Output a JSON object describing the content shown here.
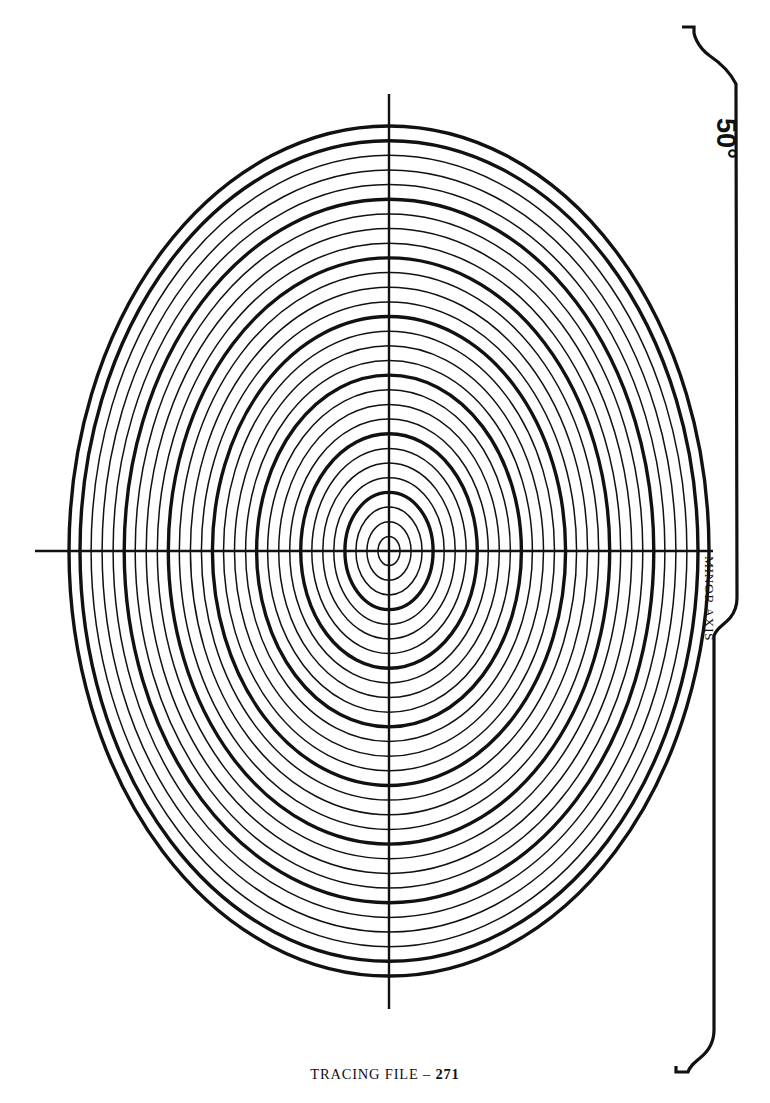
{
  "page": {
    "background_color": "#ffffff",
    "ink_color": "#111111",
    "width": 770,
    "height": 1103
  },
  "footer": {
    "caption_text": "TRACING FILE – ",
    "page_number": "271"
  },
  "annotations": {
    "angle_label": "50°",
    "minor_axis_label": "MINOR AXIS"
  },
  "chart_data": {
    "type": "line",
    "subtitle": "Ellipse template for 50 degree projection angle",
    "xlabel": "",
    "ylabel": "",
    "grid": false,
    "legend": null,
    "center": {
      "x": 389,
      "y": 551
    },
    "axes_lines": [
      {
        "name": "minor-axis-horizontal",
        "x1": 35,
        "y1": 551,
        "x2": 713,
        "y2": 551,
        "stroke_width": 2.4
      },
      {
        "name": "major-axis-vertical",
        "x1": 389,
        "y1": 94,
        "x2": 389,
        "y2": 1009,
        "stroke_width": 2.4
      }
    ],
    "ring_count": 29,
    "thick_ring_interval": 4,
    "thin_stroke_width": 1.5,
    "thick_stroke_width": 3.4,
    "outer_ring_rx": 320,
    "outer_ring_ry": 425,
    "axis_ratio_minor_over_major": 0.7529,
    "rings": [
      {
        "index": 1,
        "rx": 11.0,
        "ry": 14.6,
        "weight": "thin"
      },
      {
        "index": 2,
        "rx": 22.1,
        "ry": 29.3,
        "weight": "thin"
      },
      {
        "index": 3,
        "rx": 33.1,
        "ry": 43.9,
        "weight": "thin"
      },
      {
        "index": 4,
        "rx": 44.1,
        "ry": 58.6,
        "weight": "thick"
      },
      {
        "index": 5,
        "rx": 55.2,
        "ry": 73.3,
        "weight": "thin"
      },
      {
        "index": 6,
        "rx": 66.2,
        "ry": 87.9,
        "weight": "thin"
      },
      {
        "index": 7,
        "rx": 77.2,
        "ry": 102.6,
        "weight": "thin"
      },
      {
        "index": 8,
        "rx": 88.3,
        "ry": 117.2,
        "weight": "thick"
      },
      {
        "index": 9,
        "rx": 99.3,
        "ry": 131.9,
        "weight": "thin"
      },
      {
        "index": 10,
        "rx": 110.3,
        "ry": 146.6,
        "weight": "thin"
      },
      {
        "index": 11,
        "rx": 121.4,
        "ry": 161.2,
        "weight": "thin"
      },
      {
        "index": 12,
        "rx": 132.4,
        "ry": 175.9,
        "weight": "thick"
      },
      {
        "index": 13,
        "rx": 143.4,
        "ry": 190.5,
        "weight": "thin"
      },
      {
        "index": 14,
        "rx": 154.5,
        "ry": 205.2,
        "weight": "thin"
      },
      {
        "index": 15,
        "rx": 165.5,
        "ry": 219.8,
        "weight": "thin"
      },
      {
        "index": 16,
        "rx": 176.6,
        "ry": 234.5,
        "weight": "thick"
      },
      {
        "index": 17,
        "rx": 187.6,
        "ry": 249.1,
        "weight": "thin"
      },
      {
        "index": 18,
        "rx": 198.6,
        "ry": 263.8,
        "weight": "thin"
      },
      {
        "index": 19,
        "rx": 209.7,
        "ry": 278.4,
        "weight": "thin"
      },
      {
        "index": 20,
        "rx": 220.7,
        "ry": 293.1,
        "weight": "thick"
      },
      {
        "index": 21,
        "rx": 231.7,
        "ry": 307.8,
        "weight": "thin"
      },
      {
        "index": 22,
        "rx": 242.8,
        "ry": 322.4,
        "weight": "thin"
      },
      {
        "index": 23,
        "rx": 253.8,
        "ry": 337.1,
        "weight": "thin"
      },
      {
        "index": 24,
        "rx": 264.8,
        "ry": 351.7,
        "weight": "thick"
      },
      {
        "index": 25,
        "rx": 275.9,
        "ry": 366.4,
        "weight": "thin"
      },
      {
        "index": 26,
        "rx": 286.9,
        "ry": 381.0,
        "weight": "thin"
      },
      {
        "index": 27,
        "rx": 297.9,
        "ry": 395.7,
        "weight": "thin"
      },
      {
        "index": 28,
        "rx": 309.0,
        "ry": 410.3,
        "weight": "thick"
      },
      {
        "index": 29,
        "rx": 320.0,
        "ry": 425.0,
        "weight": "thick"
      }
    ],
    "bracket": {
      "name": "right-edge-bracket",
      "stroke_width": 3.2,
      "path": "M 682 27 L 694 27 L 694 33 C 694 33 696 46 710 56 C 722 64 730 72 736 84 L 736 97 L 737 598 C 737 606 735 612 730 618 C 724 625 716 628 714 636 L 714 1030 C 714 1040 710 1050 700 1058 C 694 1063 690 1066 688 1072 L 676 1072 L 676 1066"
    }
  }
}
